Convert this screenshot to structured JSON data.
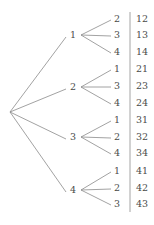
{
  "figure": {
    "kind": "probability-tree-diagram",
    "root": {
      "label": "",
      "x": 10,
      "y": 112
    },
    "line_color": "#8a8a8a",
    "rule_color": "#9a9a9a",
    "text_color": "#4a4a4a",
    "background": "#ffffff",
    "divider": {
      "x": 130,
      "y_top": 12,
      "y_bottom": 212
    },
    "level1_x": 73,
    "level2_x": 117,
    "outcome_x": 136,
    "branches": [
      {
        "label": "1",
        "y": 35,
        "children": [
          {
            "label": "2",
            "y": 19,
            "outcome": "12"
          },
          {
            "label": "3",
            "y": 35,
            "outcome": "13"
          },
          {
            "label": "4",
            "y": 52,
            "outcome": "14"
          }
        ]
      },
      {
        "label": "2",
        "y": 87,
        "children": [
          {
            "label": "1",
            "y": 69,
            "outcome": "21"
          },
          {
            "label": "3",
            "y": 86,
            "outcome": "23"
          },
          {
            "label": "4",
            "y": 103,
            "outcome": "24"
          }
        ]
      },
      {
        "label": "3",
        "y": 137,
        "children": [
          {
            "label": "1",
            "y": 120,
            "outcome": "31"
          },
          {
            "label": "2",
            "y": 137,
            "outcome": "32"
          },
          {
            "label": "4",
            "y": 153,
            "outcome": "34"
          }
        ]
      },
      {
        "label": "4",
        "y": 190,
        "children": [
          {
            "label": "1",
            "y": 171,
            "outcome": "41"
          },
          {
            "label": "2",
            "y": 188,
            "outcome": "42"
          },
          {
            "label": "3",
            "y": 204,
            "outcome": "43"
          }
        ]
      }
    ]
  }
}
